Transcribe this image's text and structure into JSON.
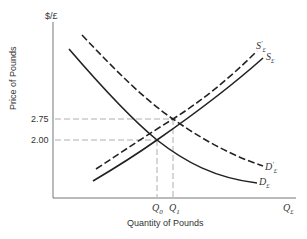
{
  "diagram": {
    "type": "supply-demand",
    "y_axis": {
      "unit_label": "$/£",
      "title": "Price of Pounds",
      "ticks": [
        "2.75",
        "2.00"
      ]
    },
    "x_axis": {
      "unit_label": "Q£",
      "title": "Quantity of Pounds",
      "ticks": [
        "Q0",
        "Q1"
      ]
    },
    "curves": [
      {
        "id": "S",
        "label": "S£",
        "style": "solid"
      },
      {
        "id": "S_prime",
        "label": "S£'",
        "style": "dashed"
      },
      {
        "id": "D",
        "label": "D£",
        "style": "solid"
      },
      {
        "id": "D_prime",
        "label": "D£'",
        "style": "dashed"
      }
    ],
    "equilibria": [
      {
        "price": "2.00",
        "quantity": "Q0"
      },
      {
        "price": "2.75",
        "quantity": "Q1"
      }
    ]
  },
  "labels": {
    "y_unit": "$/£",
    "y_title": "Price of Pounds",
    "tick_275": "2.75",
    "tick_200": "2.00",
    "q0_main": "Q",
    "q0_sub": "0",
    "q1_main": "Q",
    "q1_sub": "1",
    "x_unit_main": "Q",
    "x_unit_sub": "£",
    "x_title": "Quantity of Pounds",
    "s_main": "S",
    "s_sub": "£",
    "sp_main": "S",
    "sp_sub": "£",
    "sp_prime": "'",
    "d_main": "D",
    "d_sub": "£",
    "dp_main": "D",
    "dp_sub": "£",
    "dp_prime": "'"
  }
}
